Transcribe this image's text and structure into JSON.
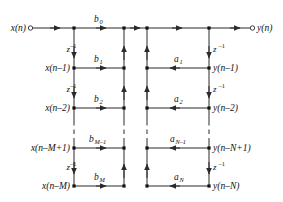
{
  "figure": {
    "line_color": "#2b2b2b",
    "node_color": "#111111",
    "text_color": "#111111",
    "background": "#ffffff"
  },
  "io": {
    "input_label": "x(n)",
    "output_label": "y(n)"
  },
  "delay_operator": "z",
  "delay_exponent": "-1",
  "left_taps": [
    {
      "signal_base": "x(n)",
      "signal_paren": "",
      "coef_base": "b",
      "coef_sub": "0",
      "delay": "z-1"
    },
    {
      "signal_base": "x(n–1)",
      "signal_paren": "",
      "coef_base": "b",
      "coef_sub": "1",
      "delay": "z-1"
    },
    {
      "signal_base": "x(n–2)",
      "signal_paren": "",
      "coef_base": "b",
      "coef_sub": "2",
      "delay": "z-1"
    },
    {
      "signal_base": "x(n–M+1)",
      "signal_paren": "",
      "coef_base": "b",
      "coef_sub": "M–1",
      "delay": "z-1"
    },
    {
      "signal_base": "x(n–M)",
      "signal_paren": "",
      "coef_base": "b",
      "coef_sub": "M",
      "delay": "z-1"
    }
  ],
  "right_taps": [
    {
      "signal_base": "y(n)",
      "coef_base": "",
      "coef_sub": "",
      "delay": "z-1"
    },
    {
      "signal_base": "y(n–1)",
      "coef_base": "a",
      "coef_sub": "1",
      "delay": "z-1"
    },
    {
      "signal_base": "y(n–2)",
      "coef_base": "a",
      "coef_sub": "2",
      "delay": "z-1"
    },
    {
      "signal_base": "y(n–N+1)",
      "coef_base": "a",
      "coef_sub": "N–1",
      "delay": "z-1"
    },
    {
      "signal_base": "y(n–N)",
      "coef_base": "a",
      "coef_sub": "N",
      "delay": "z-1"
    }
  ],
  "labels": {
    "x_n": "x(n)",
    "y_n": "y(n)",
    "x_n1": "x(n–1)",
    "x_n2": "x(n–2)",
    "x_nM1": "x(n–M+1)",
    "x_nM": "x(n–M)",
    "y_n1": "y(n–1)",
    "y_n2": "y(n–2)",
    "y_nN1": "y(n–N+1)",
    "y_nN": "y(n–N)",
    "b0": "b",
    "b0_sub": "0",
    "b1": "b",
    "b1_sub": "1",
    "b2": "b",
    "b2_sub": "2",
    "bM1": "b",
    "bM1_sub": "M–1",
    "bM": "b",
    "bM_sub": "M",
    "a1": "a",
    "a1_sub": "1",
    "a2": "a",
    "a2_sub": "2",
    "aN1": "a",
    "aN1_sub": "N–1",
    "aN": "a",
    "aN_sub": "N",
    "z": "z",
    "z_sup": "–1"
  },
  "geometry": {
    "rows_y": [
      28,
      68,
      108,
      148,
      186
    ],
    "col_x_left_delay": 74,
    "col_x_left_sum": 124,
    "col_x_right_sum": 147,
    "col_x_right_delay": 209,
    "input_terminal_x": 29,
    "output_terminal_x": 254
  }
}
